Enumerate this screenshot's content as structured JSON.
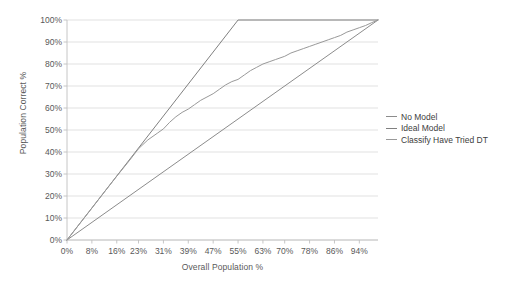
{
  "chart_data": {
    "type": "line",
    "title": "",
    "xlabel": "Overall Population %",
    "ylabel": "Population Correct %",
    "xlim": [
      0,
      100
    ],
    "ylim": [
      0,
      100
    ],
    "grid": "horizontal",
    "legend_position": "right",
    "x_tick_labels": [
      "0%",
      "8%",
      "16%",
      "23%",
      "31%",
      "39%",
      "47%",
      "55%",
      "63%",
      "70%",
      "78%",
      "86%",
      "94%"
    ],
    "x_tick_values": [
      0,
      8,
      16,
      23,
      31,
      39,
      47,
      55,
      63,
      70,
      78,
      86,
      94
    ],
    "y_tick_labels": [
      "0%",
      "10%",
      "20%",
      "30%",
      "40%",
      "50%",
      "60%",
      "70%",
      "80%",
      "90%",
      "100%"
    ],
    "y_tick_values": [
      0,
      10,
      20,
      30,
      40,
      50,
      60,
      70,
      80,
      90,
      100
    ],
    "series": [
      {
        "name": "No Model",
        "color": "#8c8c8c",
        "x": [
          0,
          100
        ],
        "values": [
          0,
          100
        ]
      },
      {
        "name": "Ideal Model",
        "color": "#808080",
        "x": [
          0,
          55,
          100
        ],
        "values": [
          0,
          100,
          100
        ]
      },
      {
        "name": "Classify Have Tried DT",
        "color": "#999999",
        "x": [
          0,
          4,
          8,
          12,
          16,
          20,
          23,
          26,
          29,
          31,
          33,
          35,
          37,
          39,
          41,
          43,
          45,
          47,
          49,
          51,
          53,
          55,
          57,
          59,
          61,
          63,
          65,
          67,
          70,
          72,
          74,
          76,
          78,
          80,
          82,
          84,
          86,
          88,
          90,
          92,
          94,
          96,
          98,
          100
        ],
        "values": [
          0,
          7.3,
          14.5,
          21.8,
          29,
          36,
          41.5,
          45.5,
          48.5,
          50.5,
          53.5,
          56,
          58,
          59.5,
          61.5,
          63.5,
          65,
          66.5,
          68.5,
          70.5,
          72,
          73,
          75,
          77,
          78.5,
          80,
          81,
          82,
          83.5,
          85,
          86,
          87,
          88,
          89,
          90,
          91,
          92,
          93,
          94.5,
          95.5,
          96.5,
          97.5,
          98.8,
          100
        ]
      }
    ]
  },
  "legend": {
    "items": [
      {
        "label": "No Model"
      },
      {
        "label": "Ideal Model"
      },
      {
        "label": "Classify Have Tried DT"
      }
    ]
  },
  "axes": {
    "x_title": "Overall Population %",
    "y_title": "Population Correct %"
  },
  "colors": {
    "gridline": "#d9d9d9",
    "axis": "#bfbfbf",
    "text": "#595959",
    "background": "#ffffff"
  }
}
